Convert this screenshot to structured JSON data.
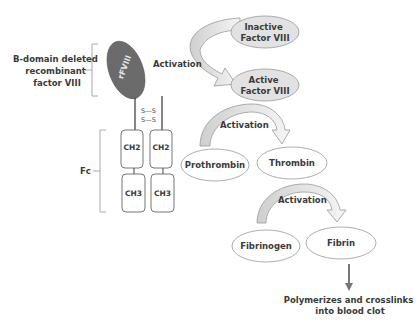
{
  "molecule": {
    "rfviii_label": "rFVIII",
    "bdomain_label_lines": [
      "B-domain deleted",
      "recombinant",
      "factor VIII"
    ],
    "fc_label": "Fc",
    "disulfide_label": "S—S",
    "ch2_label": "CH2",
    "ch3_label": "CH3"
  },
  "cascade": {
    "inactive_factor": [
      "Inactive",
      "Factor VIII"
    ],
    "active_factor": [
      "Active",
      "Factor VIII"
    ],
    "activation_label": "Activation",
    "prothrombin": "Prothrombin",
    "thrombin": "Thrombin",
    "fibrinogen": "Fibrinogen",
    "fibrin": "Fibrin",
    "outcome_lines": [
      "Polymerizes and crosslinks",
      "into blood clot"
    ]
  },
  "colors": {
    "rfviii_fill": "#6b6b6b",
    "ellipse_shaded": "#e2e2e2",
    "arrow_fill": "#eeeeee",
    "stroke": "#8a8a8a",
    "text": "#3a3a3a"
  }
}
